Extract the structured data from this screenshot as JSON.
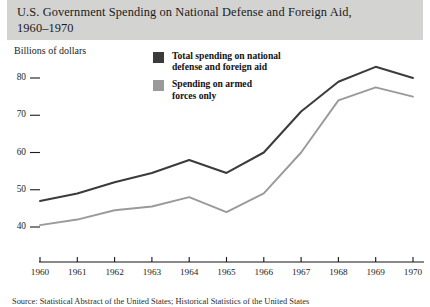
{
  "title": {
    "line1": "U.S. Government Spending on National Defense and Foreign Aid,",
    "line2": "1960–1970"
  },
  "axis_caption": "Billions of dollars",
  "legend": {
    "items": [
      {
        "color": "#3b3b3b",
        "line1": "Total spending on national",
        "line2": "defense and foreign aid"
      },
      {
        "color": "#9a9a9a",
        "line1": "Spending on armed",
        "line2": "forces only"
      }
    ]
  },
  "source": "Source: Statistical Abstract of the United States; Historical Statistics of the United States",
  "chart_data": {
    "type": "line",
    "title": "U.S. Government Spending on National Defense and Foreign Aid, 1960–1970",
    "xlabel": "",
    "ylabel": "Billions of dollars",
    "x": [
      1960,
      1961,
      1962,
      1963,
      1964,
      1965,
      1966,
      1967,
      1968,
      1969,
      1970
    ],
    "xtick_labels": [
      "1960",
      "1961",
      "1962",
      "1963",
      "1964",
      "1965",
      "1966",
      "1967",
      "1968",
      "1969",
      "1970"
    ],
    "ytick_labels": [
      "40",
      "50",
      "60",
      "70",
      "80"
    ],
    "yticks": [
      40,
      50,
      60,
      70,
      80
    ],
    "ylim": [
      36,
      86
    ],
    "xlim": [
      1960,
      1970
    ],
    "grid": false,
    "legend_position": "upper-center",
    "series": [
      {
        "name": "Total spending on national defense and foreign aid",
        "color": "#3b3b3b",
        "values": [
          47,
          49,
          52,
          54.5,
          58,
          54.5,
          60,
          71,
          79,
          83,
          80
        ]
      },
      {
        "name": "Spending on armed forces only",
        "color": "#9a9a9a",
        "values": [
          40.5,
          42,
          44.5,
          45.5,
          48,
          44,
          49,
          60,
          74,
          77.5,
          75
        ]
      }
    ]
  }
}
